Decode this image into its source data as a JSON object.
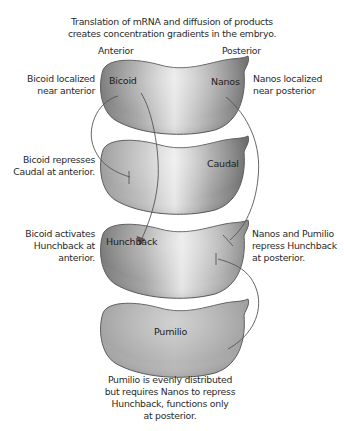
{
  "title": {
    "line1": "Translation of mRNA and diffusion of products",
    "line2": "creates concentration gradients in the embryo."
  },
  "axis_labels": {
    "anterior": "Anterior",
    "posterior": "Posterior"
  },
  "embryos": [
    {
      "name": "embryo-1",
      "labels": [
        "Bicoid",
        "Nanos"
      ],
      "gradient": "both-ends-dark"
    },
    {
      "name": "embryo-2",
      "labels": [
        "Caudal"
      ],
      "gradient": "posterior-dark"
    },
    {
      "name": "embryo-3",
      "labels": [
        "Hunchback"
      ],
      "gradient": "anterior-dark"
    },
    {
      "name": "embryo-4",
      "labels": [
        "Pumilio"
      ],
      "gradient": "uniform"
    }
  ],
  "annotations": {
    "bicoid_localized": [
      "Bicoid localized",
      "near anterior"
    ],
    "nanos_localized": [
      "Nanos localized",
      "near posterior"
    ],
    "bicoid_represses": [
      "Bicoid represses",
      "Caudal at anterior."
    ],
    "bicoid_activates": [
      "Bicoid activates",
      "Hunchback at",
      "anterior."
    ],
    "nanos_pumilio": [
      "Nanos and Pumilio",
      "repress Hunchback",
      "at posterior."
    ],
    "pumilio_note": [
      "Pumilio is evenly distributed",
      "but requires Nanos to repress",
      "Hunchback, functions only",
      "at posterior."
    ]
  },
  "colors": {
    "embryo_dark": "#7a7a7a",
    "embryo_light": "#e6e6e6",
    "outline": "#5a5a5a",
    "line": "#555555",
    "text": "#2a2a2a"
  }
}
